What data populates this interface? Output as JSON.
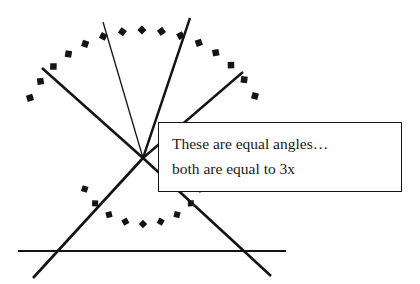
{
  "canvas": {
    "width": 420,
    "height": 284,
    "background": "#ffffff",
    "ink_color": "#141414"
  },
  "callout": {
    "line1": "These are equal angles…",
    "line2": "both are equal to 3x",
    "border_color": "#141414",
    "fill_color": "#ffffff",
    "text_color": "#1a1a1a"
  },
  "diagram_data": {
    "type": "geometry-line-diagram",
    "description": "Two pairs of vertical (opposite) angles formed by intersecting lines through a common vertex, each pair marked with a dotted arc and labelled as equal to 3x",
    "vertex": {
      "x": 143,
      "y": 158,
      "label": ""
    },
    "lines": [
      {
        "name": "thick-ray-upper-left",
        "x1": 42,
        "y1": 68,
        "x2": 143,
        "y2": 158,
        "stroke_width": 2.6,
        "color": "#141414"
      },
      {
        "name": "thin-ray-upper",
        "x1": 103,
        "y1": 22,
        "x2": 143,
        "y2": 158,
        "stroke_width": 1.3,
        "color": "#141414"
      },
      {
        "name": "thick-ray-upper-steep",
        "x1": 190,
        "y1": 18,
        "x2": 143,
        "y2": 158,
        "stroke_width": 2.4,
        "color": "#141414"
      },
      {
        "name": "thick-ray-upper-right",
        "x1": 243,
        "y1": 72,
        "x2": 143,
        "y2": 158,
        "stroke_width": 2.4,
        "color": "#141414"
      },
      {
        "name": "thick-line-down-right",
        "x1": 143,
        "y1": 158,
        "x2": 271,
        "y2": 276,
        "stroke_width": 2.6,
        "color": "#141414"
      },
      {
        "name": "thick-line-down-left",
        "x1": 143,
        "y1": 158,
        "x2": 33,
        "y2": 278,
        "stroke_width": 2.6,
        "color": "#141414"
      },
      {
        "name": "horizontal-baseline",
        "x1": 18,
        "y1": 251,
        "x2": 286,
        "y2": 251,
        "stroke_width": 2.2,
        "color": "#141414"
      }
    ],
    "arcs": [
      {
        "name": "upper-dotted-arc",
        "style": "square-dotted",
        "center_x": 143,
        "center_y": 158,
        "radius": 128,
        "start_angle_deg": 208,
        "end_angle_deg": 331,
        "marker_count": 15,
        "marker_size": 6.5,
        "color": "#141414"
      },
      {
        "name": "lower-dotted-arc",
        "style": "square-dotted",
        "center_x": 143,
        "center_y": 158,
        "radius": 66,
        "start_angle_deg": 28,
        "end_angle_deg": 152,
        "marker_count": 9,
        "marker_size": 6.0,
        "color": "#141414"
      }
    ]
  }
}
